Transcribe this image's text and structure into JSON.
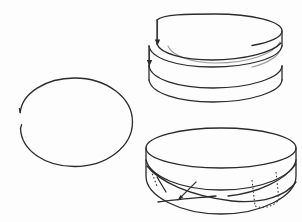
{
  "document": {
    "title": "Topological band figures",
    "background_color": "#fdfdfd",
    "ink_color": "#2b2b2b",
    "faint_ink_color": "#9a9a9a",
    "canvas": {
      "width": 302,
      "height": 222
    },
    "style": "black-and-white line drawing, no text labels"
  },
  "figures": [
    {
      "id": "split-ring",
      "name": "open ellipse ring with gap",
      "description": "A single closed ellipse drawn in perspective with a small break on its left side; the two free ends are offset vertically from each other.",
      "bounds": {
        "x": 17,
        "y": 78,
        "width": 115,
        "height": 88
      },
      "center": {
        "cx": 74.5,
        "cy": 122
      },
      "radii": {
        "rx": 57.5,
        "ry": 44
      },
      "gap": {
        "start_deg": 172,
        "end_deg": 192,
        "upper_end_y": 108,
        "lower_end_y": 128
      },
      "stroke_width": 1.3
    },
    {
      "id": "helical-coil",
      "name": "helical band wound one and a half turns",
      "description": "A cylindrical strip coiled about one and a half turns, drawn in perspective. Top rim ellipse, two intermediate helix passes, bottom rim, two short vertical end edges on the left with arrowheads indicating the winding direction, and a faint partially hidden pass on the right.",
      "bounds": {
        "x": 148,
        "y": 14,
        "width": 134,
        "height": 96
      },
      "ellipse": {
        "cx": 215,
        "cy": 30,
        "rx": 67,
        "ry": 17
      },
      "turns": 1.5,
      "band_height": 46,
      "arrows": [
        {
          "x": 157,
          "y_top": 20,
          "y_tip": 44,
          "direction": "down"
        },
        {
          "x": 149,
          "y_top": 46,
          "y_tip": 66,
          "direction": "down"
        }
      ],
      "stroke_width": 1.3
    },
    {
      "id": "mobius-band",
      "name": "twisted band with crossing edges",
      "description": "A wide band in perspective whose lower edge crosses over itself near the left of centre, producing a half twist. Dotted segments mark the edges hidden behind the surface on the left and right flanks, and a short arrow on the lower-left indicates orientation.",
      "bounds": {
        "x": 146,
        "y": 128,
        "width": 150,
        "height": 90
      },
      "ellipse": {
        "cx": 221,
        "cy": 148,
        "rx": 75,
        "ry": 20
      },
      "band_height": 48,
      "crossing_point": {
        "x": 216,
        "y": 193
      },
      "hidden_edges": [
        {
          "id": "left-hidden",
          "x": 152,
          "y_top": 171,
          "y_bottom": 186
        },
        {
          "id": "right-hidden-inner",
          "x": 254,
          "y_top": 180,
          "y_bottom": 205
        },
        {
          "id": "right-hidden-outer",
          "x": 277,
          "y_top": 173,
          "y_bottom": 200
        }
      ],
      "arrows": [
        {
          "x_tail": 196,
          "y_tail": 182,
          "x_tip": 178,
          "y_tip": 200,
          "direction": "down-left"
        }
      ],
      "stroke_width": 1.3
    }
  ]
}
